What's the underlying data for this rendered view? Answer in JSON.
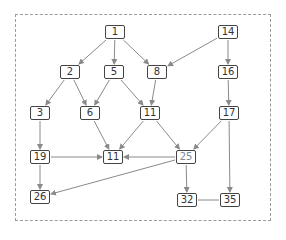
{
  "diagram": {
    "type": "directed-graph",
    "colors": {
      "node_border": "#444444",
      "edge": "#8a8a8a",
      "frame": "#9a9a9a",
      "highlight_text": "#7a8a9a"
    },
    "nodes": [
      {
        "id": "n1",
        "label": "1",
        "x": 115,
        "y": 32
      },
      {
        "id": "n14",
        "label": "14",
        "x": 228,
        "y": 32
      },
      {
        "id": "n2",
        "label": "2",
        "x": 70,
        "y": 72
      },
      {
        "id": "n5",
        "label": "5",
        "x": 114,
        "y": 72
      },
      {
        "id": "n8",
        "label": "8",
        "x": 157,
        "y": 72
      },
      {
        "id": "n16",
        "label": "16",
        "x": 228,
        "y": 72
      },
      {
        "id": "n3",
        "label": "3",
        "x": 40,
        "y": 113
      },
      {
        "id": "n6",
        "label": "6",
        "x": 90,
        "y": 113
      },
      {
        "id": "n11a",
        "label": "11",
        "x": 150,
        "y": 113
      },
      {
        "id": "n17",
        "label": "17",
        "x": 229,
        "y": 113
      },
      {
        "id": "n19",
        "label": "19",
        "x": 40,
        "y": 157
      },
      {
        "id": "n11b",
        "label": "11",
        "x": 113,
        "y": 157
      },
      {
        "id": "n25",
        "label": "25",
        "x": 186,
        "y": 157,
        "light": true
      },
      {
        "id": "n26",
        "label": "26",
        "x": 40,
        "y": 197
      },
      {
        "id": "n32",
        "label": "32",
        "x": 187,
        "y": 200
      },
      {
        "id": "n35",
        "label": "35",
        "x": 230,
        "y": 200
      }
    ],
    "edges": [
      {
        "from": "n1",
        "to": "n2",
        "arrow": true
      },
      {
        "from": "n1",
        "to": "n5",
        "arrow": true
      },
      {
        "from": "n1",
        "to": "n8",
        "arrow": true
      },
      {
        "from": "n14",
        "to": "n8",
        "arrow": true
      },
      {
        "from": "n14",
        "to": "n16",
        "arrow": true
      },
      {
        "from": "n2",
        "to": "n3",
        "arrow": true
      },
      {
        "from": "n2",
        "to": "n6",
        "arrow": true
      },
      {
        "from": "n5",
        "to": "n6",
        "arrow": true
      },
      {
        "from": "n5",
        "to": "n11a",
        "arrow": true
      },
      {
        "from": "n8",
        "to": "n11a",
        "arrow": true
      },
      {
        "from": "n16",
        "to": "n17",
        "arrow": true
      },
      {
        "from": "n3",
        "to": "n19",
        "arrow": true
      },
      {
        "from": "n6",
        "to": "n11b",
        "arrow": true
      },
      {
        "from": "n11a",
        "to": "n11b",
        "arrow": true
      },
      {
        "from": "n11a",
        "to": "n25",
        "arrow": true
      },
      {
        "from": "n17",
        "to": "n25",
        "arrow": true
      },
      {
        "from": "n17",
        "to": "n35",
        "arrow": true
      },
      {
        "from": "n19",
        "to": "n11b",
        "arrow": true
      },
      {
        "from": "n19",
        "to": "n26",
        "arrow": true
      },
      {
        "from": "n25",
        "to": "n11b",
        "arrow": true
      },
      {
        "from": "n25",
        "to": "n26",
        "arrow": true
      },
      {
        "from": "n25",
        "to": "n32",
        "arrow": true
      },
      {
        "from": "n32",
        "to": "n35",
        "arrow": false
      }
    ]
  }
}
